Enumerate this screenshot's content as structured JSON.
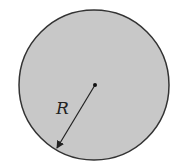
{
  "diagram": {
    "type": "circle-radius",
    "circle": {
      "cx": 94,
      "cy": 85,
      "r": 75,
      "fill": "#c8c8c8",
      "stroke": "#333333"
    },
    "center_dot": {
      "x": 95,
      "y": 85
    },
    "radius_arrow": {
      "x1": 95,
      "y1": 85,
      "x2": 56,
      "y2": 150
    },
    "label": "R"
  }
}
